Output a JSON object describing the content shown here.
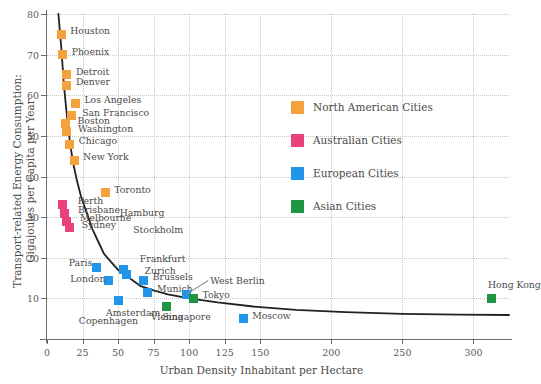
{
  "chart_data": {
    "type": "scatter",
    "title": "",
    "xlabel": "Urban Density Inhabitant per Hectare",
    "ylabel_line1": "Transport-related Energy Consumption:",
    "ylabel_line2": "Gigajoules per Capita per Year",
    "xlim": [
      0,
      325
    ],
    "ylim": [
      0,
      80
    ],
    "xticks": [
      0,
      25,
      50,
      75,
      100,
      125,
      150,
      200,
      250,
      300
    ],
    "xtick_labels": [
      "0",
      "25",
      "50",
      "75",
      "100",
      "125",
      "150",
      "200",
      "250",
      "300"
    ],
    "yticks": [
      10,
      20,
      30,
      40,
      50,
      60,
      70,
      80
    ],
    "ytick_labels": [
      "10",
      "20",
      "30",
      "40",
      "50",
      "60",
      "70",
      "80"
    ],
    "grid": true,
    "legend_position": "upper-right-inside",
    "colors": {
      "north_american": "#F5A23C",
      "australian": "#E8417C",
      "european": "#2196E8",
      "asian": "#1E9641"
    },
    "legend": [
      {
        "label": "North American Cities",
        "color": "#F5A23C"
      },
      {
        "label": "Australian Cities",
        "color": "#E8417C"
      },
      {
        "label": "European Cities",
        "color": "#2196E8"
      },
      {
        "label": "Asian Cities",
        "color": "#1E9641"
      }
    ],
    "series": [
      {
        "name": "North American Cities",
        "color": "#F5A23C",
        "points": [
          {
            "city": "Houston",
            "x": 10,
            "y": 75,
            "label_dx": 9,
            "label_dy": -4
          },
          {
            "city": "Phoenix",
            "x": 11,
            "y": 70,
            "label_dx": 9,
            "label_dy": -4
          },
          {
            "city": "Detroit",
            "x": 14,
            "y": 65,
            "label_dx": 9,
            "label_dy": -4
          },
          {
            "city": "Denver",
            "x": 14,
            "y": 62.5,
            "label_dx": 9,
            "label_dy": -4
          },
          {
            "city": "Los Angeles",
            "x": 20,
            "y": 58,
            "label_dx": 9,
            "label_dy": -4
          },
          {
            "city": "San Francisco",
            "x": 17,
            "y": 55,
            "label_dx": 11,
            "label_dy": -4
          },
          {
            "city": "Boston",
            "x": 13,
            "y": 53,
            "label_dx": 12,
            "label_dy": -4
          },
          {
            "city": "Washington",
            "x": 14,
            "y": 51,
            "label_dx": 11,
            "label_dy": -4
          },
          {
            "city": "Chicago",
            "x": 16,
            "y": 48,
            "label_dx": 9,
            "label_dy": -4
          },
          {
            "city": "New York",
            "x": 19,
            "y": 44,
            "label_dx": 9,
            "label_dy": -4
          },
          {
            "city": "Toronto",
            "x": 41,
            "y": 36,
            "label_dx": 9,
            "label_dy": -4
          }
        ]
      },
      {
        "name": "Australian Cities",
        "color": "#E8417C",
        "points": [
          {
            "city": "Perth",
            "x": 11,
            "y": 33,
            "label_dx": 15,
            "label_dy": -5
          },
          {
            "city": "Brisbane",
            "x": 12,
            "y": 31,
            "label_dx": 14,
            "label_dy": -4
          },
          {
            "city": "Melbourne",
            "x": 14,
            "y": 29,
            "label_dx": 13,
            "label_dy": -4
          },
          {
            "city": "Sydney",
            "x": 16,
            "y": 27.5,
            "label_dx": 12,
            "label_dy": -3
          }
        ]
      },
      {
        "name": "European Cities",
        "color": "#2196E8",
        "points": [
          {
            "city": "Hamburg",
            "x": 42,
            "y": 24,
            "label_dx": 13,
            "label_dy": -30,
            "label_only": true
          },
          {
            "city": "Stockholm",
            "x": 48,
            "y": 21,
            "label_dx": 18,
            "label_dy": -25,
            "label_only": true
          },
          {
            "city": "Frankfurt",
            "x": 54,
            "y": 17,
            "label_dx": 16,
            "label_dy": -12
          },
          {
            "city": "Zurich",
            "x": 56,
            "y": 16,
            "label_dx": 18,
            "label_dy": -4
          },
          {
            "city": "Paris",
            "x": 35,
            "y": 17.5,
            "label_dx": -28,
            "label_dy": -6
          },
          {
            "city": "London",
            "x": 43,
            "y": 14.5,
            "label_dx": -38,
            "label_dy": -2
          },
          {
            "city": "Brussels",
            "x": 68,
            "y": 14.5,
            "label_dx": 9,
            "label_dy": -4
          },
          {
            "city": "Munich",
            "x": 71,
            "y": 11.5,
            "label_dx": 9,
            "label_dy": -4
          },
          {
            "city": "Vienna",
            "x": 73,
            "y": 11,
            "label_dx": 0,
            "label_dy": 22,
            "label_only": true
          },
          {
            "city": "Copenhagen",
            "x": 28,
            "y": 10.5,
            "label_dx": -8,
            "label_dy": 24,
            "label_only": true
          },
          {
            "city": "Amsterdam",
            "x": 50,
            "y": 9.5,
            "label_dx": -12,
            "label_dy": 12
          },
          {
            "city": "West Berlin",
            "x": 98,
            "y": 11,
            "label_dx": 24,
            "label_dy": -14,
            "leader": true
          },
          {
            "city": "Moscow",
            "x": 138,
            "y": 5,
            "label_dx": 9,
            "label_dy": -4
          }
        ]
      },
      {
        "name": "Asian Cities",
        "color": "#1E9641",
        "points": [
          {
            "city": "Singapore",
            "x": 84,
            "y": 8,
            "label_dx": -4,
            "label_dy": 9
          },
          {
            "city": "Tokyo",
            "x": 103,
            "y": 10,
            "label_dx": 9,
            "label_dy": -4
          },
          {
            "city": "Hong Kong",
            "x": 313,
            "y": 10,
            "label_dx": -4,
            "label_dy": -14
          }
        ]
      }
    ],
    "fit_curve": {
      "description": "decreasing power-law trend line",
      "points": [
        [
          8,
          80
        ],
        [
          10,
          72
        ],
        [
          12,
          62
        ],
        [
          14,
          55
        ],
        [
          16,
          49
        ],
        [
          18,
          44
        ],
        [
          21,
          39
        ],
        [
          24,
          35
        ],
        [
          28,
          31
        ],
        [
          32,
          27
        ],
        [
          36,
          24
        ],
        [
          40,
          21
        ],
        [
          45,
          19
        ],
        [
          50,
          17
        ],
        [
          58,
          15
        ],
        [
          66,
          13
        ],
        [
          75,
          12
        ],
        [
          85,
          11
        ],
        [
          100,
          10
        ],
        [
          120,
          9
        ],
        [
          145,
          8
        ],
        [
          175,
          7.2
        ],
        [
          210,
          6.6
        ],
        [
          250,
          6.2
        ],
        [
          290,
          6.0
        ],
        [
          325,
          5.9
        ]
      ]
    }
  }
}
